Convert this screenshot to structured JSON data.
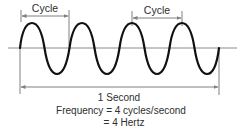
{
  "diagram": {
    "type": "sine-wave-frequency",
    "colors": {
      "wave": "#111111",
      "guide_lines": "#808080",
      "text": "#2e2e2e",
      "background": "#ffffff"
    },
    "wave": {
      "cycles": 4,
      "start_x": 20,
      "end_x": 219,
      "baseline_y": 48,
      "peak_y": 23,
      "trough_y": 74
    },
    "labels": {
      "cycle_1": "Cycle",
      "cycle_2": "Cycle",
      "duration": "1 Second",
      "frequency_line1": "Frequency = 4 cycles/second",
      "frequency_line2": "= 4 Hertz"
    },
    "annotations": [
      {
        "name": "cycle-1-span",
        "label": "Cycle",
        "from_x": 21,
        "to_x": 69,
        "y": 16,
        "meaning": "zero-crossing to zero-crossing"
      },
      {
        "name": "cycle-2-span",
        "label": "Cycle",
        "from_x": 132,
        "to_x": 182,
        "y": 18,
        "meaning": "peak to peak"
      },
      {
        "name": "one-second-span",
        "label": "1 Second",
        "from_x": 20,
        "to_x": 219,
        "y": 87
      }
    ]
  }
}
